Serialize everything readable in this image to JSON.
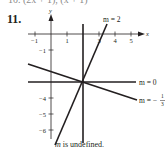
{
  "header": {
    "cut_text": "10. (2x + 1), (x + 1)",
    "problem_number": "11."
  },
  "axes": {
    "x_label": "x",
    "y_label": "y",
    "x_ticks": [
      "−1",
      "1",
      "3",
      "4",
      "5"
    ],
    "y_ticks": [
      "−1",
      "−4",
      "−5",
      "−6"
    ]
  },
  "lines": [
    {
      "id": "slope-2",
      "label": "m = 2",
      "slope": 2,
      "point": [
        2,
        -3
      ]
    },
    {
      "id": "slope-0",
      "label": "m = 0",
      "slope": 0,
      "point": [
        2,
        -3
      ]
    },
    {
      "id": "slope-neg-third",
      "label_prefix": "m = −",
      "label_num": "1",
      "label_den": "3",
      "slope": -0.3333,
      "point": [
        2,
        -3
      ]
    },
    {
      "id": "slope-undefined",
      "label_var": "m",
      "label_rest": " is undefined.",
      "slope": null,
      "point": [
        2,
        -3
      ]
    }
  ],
  "colors": {
    "ink": "#231f20",
    "axis": "#231f20"
  }
}
